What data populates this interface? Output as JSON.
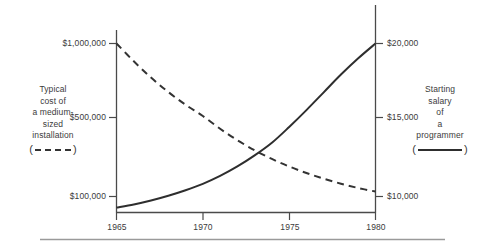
{
  "chart_data": {
    "type": "line",
    "title": "",
    "xlabel": "",
    "x_ticks": [
      "1965",
      "1970",
      "1975",
      "1980"
    ],
    "x_values": [
      1965,
      1970,
      1975,
      1980
    ],
    "xlim": [
      1965,
      1980
    ],
    "grid": false,
    "legend_position": "outside-left-and-right",
    "left_axis": {
      "label": "Typical cost of a medium-sized installation",
      "label_lines": [
        "Typical",
        "cost of",
        "a medium-",
        "sized",
        "installation"
      ],
      "tick_labels": [
        "$1,000,000",
        "$500,000",
        "$100,000"
      ],
      "tick_values": [
        1000000,
        500000,
        100000
      ],
      "legend_style": "dashed"
    },
    "right_axis": {
      "label": "Starting salary of a programmer",
      "label_lines": [
        "Starting",
        "salary",
        "of",
        "a",
        "programmer"
      ],
      "tick_labels": [
        "$20,000",
        "$15,000",
        "$10,000"
      ],
      "tick_values": [
        20000,
        15000,
        10000
      ],
      "legend_style": "solid"
    },
    "series": [
      {
        "name": "Typical cost of a medium-sized installation",
        "axis": "left",
        "style": "dashed",
        "color": "#333333",
        "x": [
          1965,
          1966,
          1967,
          1968,
          1969,
          1970,
          1971,
          1972,
          1973,
          1974,
          1975,
          1976,
          1977,
          1978,
          1979,
          1980
        ],
        "values": [
          1000000,
          880000,
          770000,
          672000,
          586000,
          510000,
          443000,
          385000,
          334000,
          290000,
          252000,
          219000,
          190000,
          165000,
          143000,
          125000
        ]
      },
      {
        "name": "Starting salary of a programmer",
        "axis": "right",
        "style": "solid",
        "color": "#2e2e2e",
        "x": [
          1965,
          1966,
          1967,
          1968,
          1969,
          1970,
          1971,
          1972,
          1973,
          1974,
          1975,
          1976,
          1977,
          1978,
          1979,
          1980
        ],
        "values": [
          9300,
          9500,
          9750,
          10050,
          10400,
          10800,
          11300,
          11900,
          12600,
          13400,
          14400,
          15500,
          16700,
          17900,
          19000,
          20000
        ]
      }
    ],
    "annotations": []
  },
  "ticks": {
    "left": {
      "top": "$1,000,000",
      "middle": "$500,000",
      "bottom": "$100,000"
    },
    "right": {
      "top": "$20,000",
      "middle": "$15,000",
      "bottom": "$10,000"
    },
    "x": {
      "t0": "1965",
      "t1": "1970",
      "t2": "1975",
      "t3": "1980"
    }
  },
  "labels": {
    "left": {
      "l0": "Typical",
      "l1": "cost of",
      "l2": "a medium-",
      "l3": "sized",
      "l4": "installation"
    },
    "right": {
      "l0": "Starting",
      "l1": "salary",
      "l2": "of",
      "l3": "a",
      "l4": "programmer"
    },
    "paren_open": "(",
    "paren_close": ")"
  }
}
